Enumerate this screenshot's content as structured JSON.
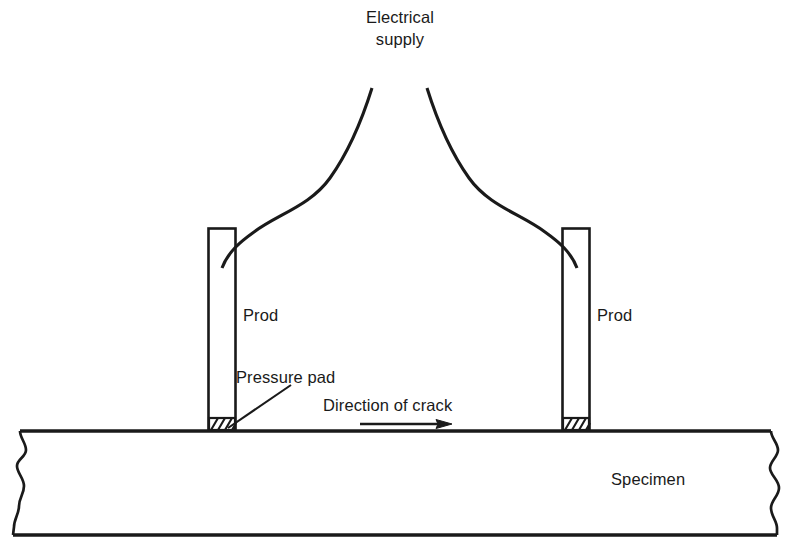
{
  "diagram": {
    "title_label": "Electrical supply",
    "labels": {
      "supply_line1": "Electrical",
      "supply_line2": "supply",
      "prod_left": "Prod",
      "prod_right": "Prod",
      "pressure_pad": "Pressure pad",
      "direction_of_crack": "Direction of crack",
      "specimen": "Specimen"
    },
    "icons": {
      "crack_arrow": "arrow-right-icon",
      "cable_left": "cable-curve-icon",
      "cable_right": "cable-curve-icon",
      "pad_left": "hatched-pad-icon",
      "pad_right": "hatched-pad-icon",
      "break_left": "break-line-icon",
      "break_right": "break-line-icon",
      "leader_line": "leader-line-icon"
    },
    "colors": {
      "ink": "#1a1a1a",
      "background": "#ffffff"
    },
    "geometry": {
      "prod_left_x": 208,
      "prod_right_x": 562,
      "prod_top_y": 228,
      "prod_width": 27,
      "prod_bottom_y": 431,
      "specimen_top_y": 431,
      "specimen_bottom_y": 535,
      "arrow_y": 424,
      "arrow_x_start": 360,
      "arrow_x_end": 452
    }
  }
}
